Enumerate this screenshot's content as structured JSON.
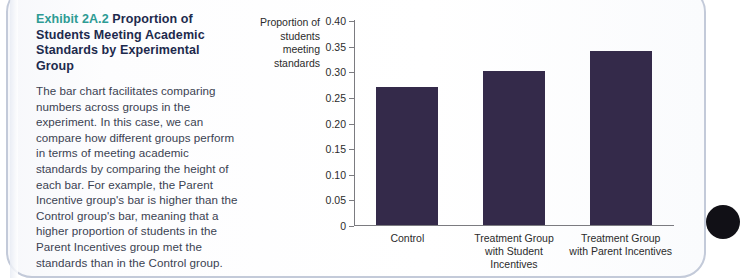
{
  "exhibit": {
    "number": "Exhibit 2A.2",
    "title": "Proportion of Students Meeting Academic Standards by Experimental Group",
    "body": "The bar chart facilitates comparing numbers across groups in the experiment. In this case, we can compare how different groups perform in terms of meeting academic standards by comparing the height of each bar. For example, the Parent Incentive group's bar is higher than the Control group's bar, meaning that a higher proportion of students in the Parent Incentives group met the standards than in the Control group."
  },
  "colors": {
    "bar": "#342a4a",
    "exhibit_number": "#2e9b94",
    "title": "#1d2a4d",
    "body_text": "#3b4252",
    "axis": "#7b7b80",
    "panel_border": "#c3cad9"
  },
  "chart_data": {
    "type": "bar",
    "title": "",
    "xlabel": "",
    "ylabel": "Proportion of students meeting standards",
    "categories": [
      "Control",
      "Treatment Group\nwith Student Incentives",
      "Treatment Group\nwith Parent Incentives"
    ],
    "values": [
      0.27,
      0.3,
      0.34
    ],
    "ylim": [
      0,
      0.4
    ],
    "yticks": [
      0.4,
      0.35,
      0.3,
      0.25,
      0.2,
      0.15,
      0.1,
      0.05,
      0
    ],
    "ytick_labels": [
      "0.40",
      "0.35",
      "0.30",
      "0.25",
      "0.20",
      "0.15",
      "0.10",
      "0.05",
      "0"
    ],
    "grid": false,
    "legend": false
  }
}
